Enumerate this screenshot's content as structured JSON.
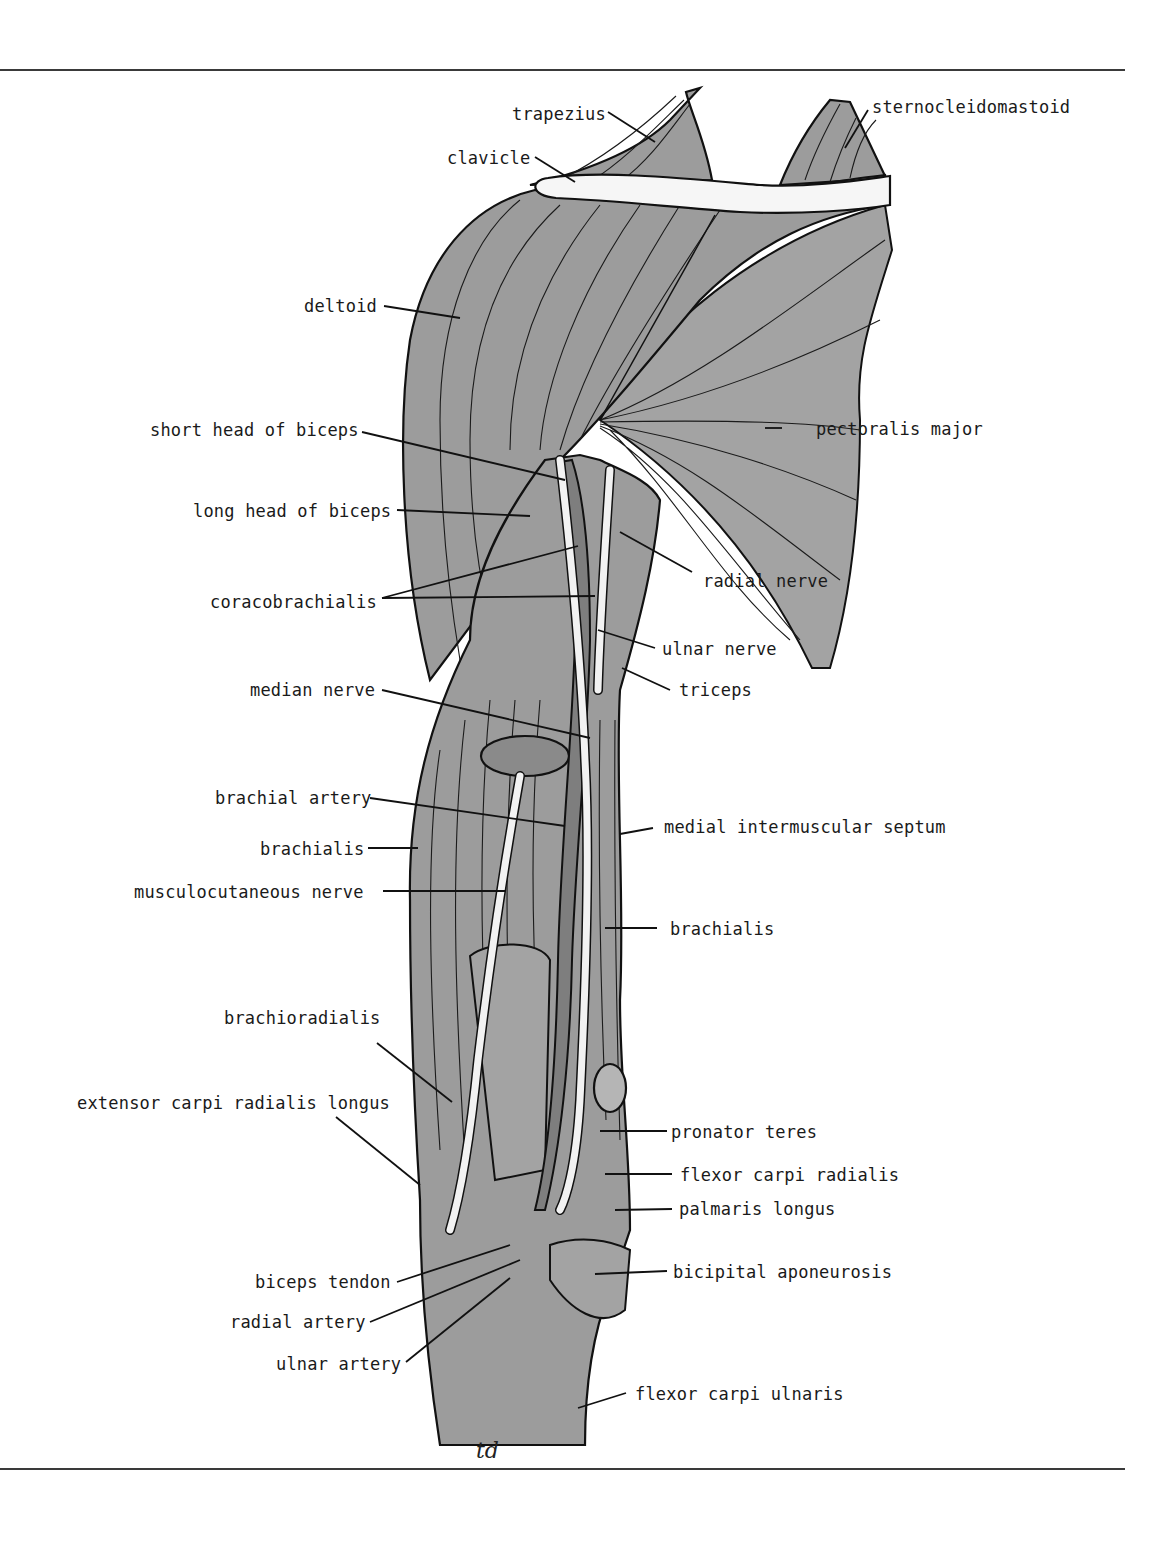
{
  "figure": {
    "signature": "td",
    "colors": {
      "muscle": "#9c9c9c",
      "outline": "#111111",
      "bone_nerve": "#f4f4f4",
      "artery": "#7e7e7e",
      "rule": "#3a3a3a"
    }
  },
  "labels": {
    "left": [
      {
        "id": "deltoid",
        "text": "deltoid"
      },
      {
        "id": "short-head-of-biceps",
        "text": "short head of biceps"
      },
      {
        "id": "long-head-of-biceps",
        "text": "long head of biceps"
      },
      {
        "id": "coracobrachialis",
        "text": "coracobrachialis"
      },
      {
        "id": "median-nerve",
        "text": "median nerve"
      },
      {
        "id": "brachial-artery",
        "text": "brachial artery"
      },
      {
        "id": "brachialis-left",
        "text": "brachialis"
      },
      {
        "id": "musculocutaneous-nerve",
        "text": "musculocutaneous nerve"
      },
      {
        "id": "brachioradialis",
        "text": "brachioradialis"
      },
      {
        "id": "extensor-carpi-radialis-longus",
        "text": "extensor carpi radialis longus"
      },
      {
        "id": "biceps-tendon",
        "text": "biceps tendon"
      },
      {
        "id": "radial-artery",
        "text": "radial artery"
      },
      {
        "id": "ulnar-artery",
        "text": "ulnar artery"
      }
    ],
    "right": [
      {
        "id": "trapezius",
        "text": "trapezius"
      },
      {
        "id": "clavicle",
        "text": "clavicle"
      },
      {
        "id": "sternocleidomastoid",
        "text": "sternocleidomastoid"
      },
      {
        "id": "pectoralis-major",
        "text": "pectoralis major"
      },
      {
        "id": "radial-nerve",
        "text": "radial nerve"
      },
      {
        "id": "ulnar-nerve",
        "text": "ulnar nerve"
      },
      {
        "id": "triceps",
        "text": "triceps"
      },
      {
        "id": "medial-intermuscular-septum",
        "text": "medial intermuscular septum"
      },
      {
        "id": "brachialis-right",
        "text": "brachialis"
      },
      {
        "id": "pronator-teres",
        "text": "pronator teres"
      },
      {
        "id": "flexor-carpi-radialis",
        "text": "flexor carpi radialis"
      },
      {
        "id": "palmaris-longus",
        "text": "palmaris longus"
      },
      {
        "id": "bicipital-aponeurosis",
        "text": "bicipital aponeurosis"
      },
      {
        "id": "flexor-carpi-ulnaris",
        "text": "flexor carpi ulnaris"
      }
    ]
  }
}
